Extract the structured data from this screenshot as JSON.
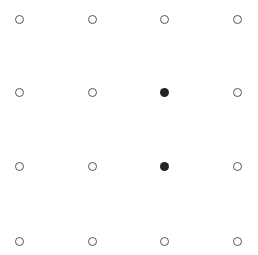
{
  "board": {
    "rows": 4,
    "cols": 4,
    "col_x": [
      19,
      92,
      164,
      237
    ],
    "row_y": [
      19,
      92,
      166,
      241
    ],
    "colors": {
      "empty_border": "#555555",
      "filled": "#222222",
      "background": "#ffffff"
    },
    "cells": [
      [
        0,
        0,
        0,
        0
      ],
      [
        0,
        0,
        1,
        0
      ],
      [
        0,
        0,
        1,
        0
      ],
      [
        0,
        0,
        0,
        0
      ]
    ]
  }
}
